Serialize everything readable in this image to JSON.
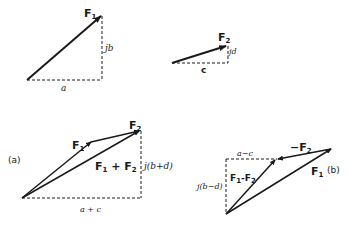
{
  "diagram": {
    "colors": {
      "ink": "#1a1a1a",
      "background": "#ffffff"
    },
    "top_left": {
      "vector_label": "F",
      "vector_sub": "1",
      "imag_label": "jb",
      "real_label": "a"
    },
    "top_right": {
      "vector_label": "F",
      "vector_sub": "2",
      "imag_label": "jd",
      "real_label": "c"
    },
    "panel_a": {
      "tag": "(a)",
      "f1_label": "F",
      "f1_sub": "1",
      "f2_label": "F",
      "f2_sub": "2",
      "sum_label_a": "F",
      "sum_sub_a": "1",
      "sum_op": " + F",
      "sum_sub_b": "2",
      "imag_label": "j(b+d)",
      "real_label": "a + c"
    },
    "panel_b": {
      "tag": "(b)",
      "neg_f2_label": "−F",
      "neg_f2_sub": "2",
      "f1_label": "F",
      "f1_sub": "1",
      "diff_label_a": "F",
      "diff_sub_a": "1",
      "diff_op": "-F",
      "diff_sub_b": "2",
      "imag_label": "j(b−d)",
      "real_label": "a−c"
    }
  }
}
